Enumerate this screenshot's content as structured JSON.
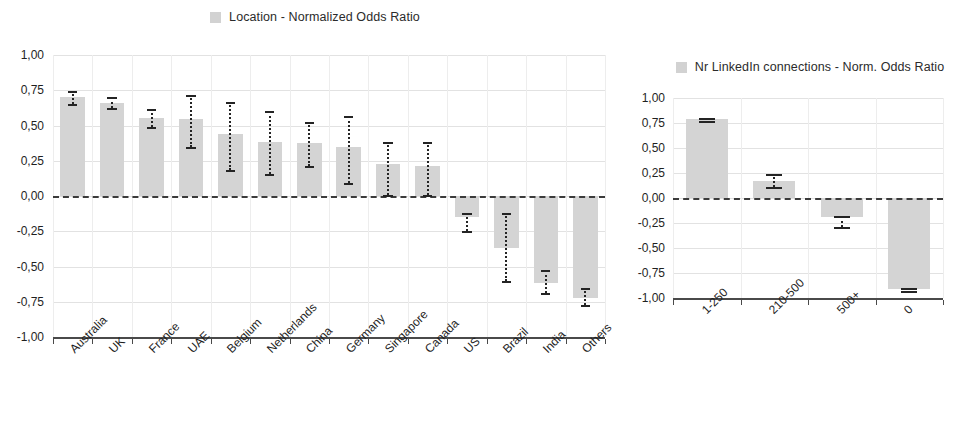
{
  "chart_data": [
    {
      "id": "location",
      "type": "bar",
      "title": "Location - Normalized Odds Ratio",
      "legend_label": "Location - Normalized Odds Ratio",
      "legend_position": "top-center",
      "xlabel": "",
      "ylabel": "",
      "ylim": [
        -1.0,
        1.0
      ],
      "ytick_labels": [
        "1,00",
        "0,75",
        "0,50",
        "0,25",
        "0,00",
        "-0,25",
        "-0,50",
        "-0,75",
        "-1,00"
      ],
      "ytick_values": [
        1.0,
        0.75,
        0.5,
        0.25,
        0.0,
        -0.25,
        -0.5,
        -0.75,
        -1.0
      ],
      "grid": true,
      "zero_reference_line": true,
      "bar_color": "#d4d4d4",
      "error_color": "#242424",
      "categories": [
        "Australia",
        "UK",
        "France",
        "UAE",
        "Belgium",
        "Netherlands",
        "China",
        "Germany",
        "Singapore",
        "Canada",
        "US",
        "Brazil",
        "India",
        "Others"
      ],
      "values": [
        0.7,
        0.66,
        0.55,
        0.545,
        0.44,
        0.385,
        0.375,
        0.35,
        0.225,
        0.21,
        -0.15,
        -0.37,
        -0.62,
        -0.72
      ],
      "error_low": [
        0.655,
        0.625,
        0.49,
        0.345,
        0.185,
        0.155,
        0.215,
        0.09,
        0.005,
        0.005,
        -0.245,
        -0.605,
        -0.69,
        -0.775
      ],
      "error_high": [
        0.745,
        0.7,
        0.615,
        0.715,
        0.665,
        0.6,
        0.525,
        0.565,
        0.385,
        0.385,
        -0.12,
        -0.12,
        -0.525,
        -0.655
      ]
    },
    {
      "id": "linkedin",
      "type": "bar",
      "title": "Nr LinkedIn connections - Norm. Odds Ratio",
      "legend_label": "Nr LinkedIn connections - Norm. Odds Ratio",
      "legend_position": "top-center",
      "xlabel": "",
      "ylabel": "",
      "ylim": [
        -1.0,
        1.0
      ],
      "ytick_labels": [
        "1,00",
        "0,75",
        "0,50",
        "0,25",
        "0,00",
        "-0,25",
        "-0,50",
        "-0,75",
        "-1,00"
      ],
      "ytick_values": [
        1.0,
        0.75,
        0.5,
        0.25,
        0.0,
        -0.25,
        -0.5,
        -0.75,
        -1.0
      ],
      "grid": true,
      "zero_reference_line": true,
      "bar_color": "#d4d4d4",
      "error_color": "#242424",
      "categories": [
        "1-250",
        "210-500",
        "500+",
        "0"
      ],
      "values": [
        0.79,
        0.17,
        -0.19,
        -0.91
      ],
      "error_low": [
        0.775,
        0.115,
        -0.285,
        -0.925
      ],
      "error_high": [
        0.8,
        0.24,
        -0.175,
        -0.895
      ]
    }
  ]
}
